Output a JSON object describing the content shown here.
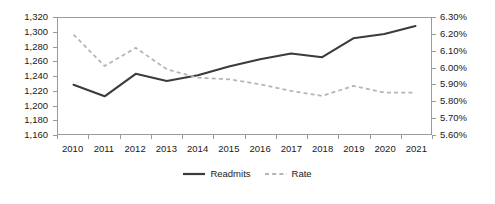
{
  "chart_data": {
    "type": "line",
    "title": "",
    "subtitle": "",
    "xlabel": "",
    "ylabel": "",
    "grid": false,
    "legend_position": "bottom",
    "categories": [
      "2010",
      "2011",
      "2012",
      "2013",
      "2014",
      "2015",
      "2016",
      "2017",
      "2018",
      "2019",
      "2020",
      "2021"
    ],
    "x": [
      2010,
      2011,
      2012,
      2013,
      2014,
      2015,
      2016,
      2017,
      2018,
      2019,
      2020,
      2021
    ],
    "axes": {
      "left": {
        "label": "",
        "ylim": [
          1160,
          1320
        ],
        "tick_step": 20,
        "ticks": [
          1320,
          1300,
          1280,
          1260,
          1240,
          1220,
          1200,
          1180,
          1160
        ],
        "tick_labels": [
          "1,320",
          "1,300",
          "1,280",
          "1,260",
          "1,240",
          "1,220",
          "1,200",
          "1,180",
          "1,160"
        ]
      },
      "right": {
        "label": "",
        "ylim": [
          5.6,
          6.3
        ],
        "tick_step": 0.1,
        "ticks": [
          6.3,
          6.2,
          6.1,
          6.0,
          5.9,
          5.8,
          5.7,
          5.6
        ],
        "tick_labels": [
          "6.30%",
          "6.20%",
          "6.10%",
          "6.00%",
          "5.90%",
          "5.80%",
          "5.70%",
          "5.60%"
        ]
      }
    },
    "series": [
      {
        "name": "Readmits",
        "axis": "left",
        "style": "solid",
        "color": "#3b3b3b",
        "values": [
          1228,
          1212,
          1243,
          1233,
          1241,
          1253,
          1263,
          1271,
          1266,
          1292,
          1298,
          1309
        ]
      },
      {
        "name": "Rate",
        "axis": "right",
        "style": "dashed",
        "color": "#b5b5b5",
        "values": [
          6.2,
          6.01,
          6.12,
          5.99,
          5.94,
          5.93,
          5.9,
          5.86,
          5.83,
          5.89,
          5.85,
          5.85
        ]
      }
    ]
  },
  "legend": {
    "items": [
      {
        "label": "Readmits",
        "icon": "solid-line-icon"
      },
      {
        "label": "Rate",
        "icon": "dashed-line-icon"
      }
    ]
  },
  "colors": {
    "readmits_line": "#3b3b3b",
    "rate_line": "#b5b5b5",
    "frame": "#9a9a9a",
    "text": "#202020",
    "background": "#ffffff"
  }
}
